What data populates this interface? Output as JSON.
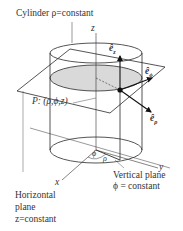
{
  "labels": {
    "cylinder": "Cylinder ρ=constant",
    "z_axis": "z",
    "x_axis": "x",
    "y_axis": "y",
    "point": "P: (ρ,ϕ,z)",
    "phi_angle": "ϕ",
    "rho_dist": "ρ",
    "vertical_plane_1": "Vertical plane",
    "vertical_plane_2": "ϕ = constant",
    "horizontal_plane_1": "Horizontal",
    "horizontal_plane_2": "plane",
    "horizontal_plane_3": "z=constant",
    "e_z": "ê",
    "e_z_sub": "z",
    "e_phi": "ê",
    "e_phi_sub": "ϕ",
    "e_rho": "ê",
    "e_rho_sub": "ρ"
  },
  "colors": {
    "line": "#2a2a2a",
    "fill": "#d9d9d9"
  }
}
